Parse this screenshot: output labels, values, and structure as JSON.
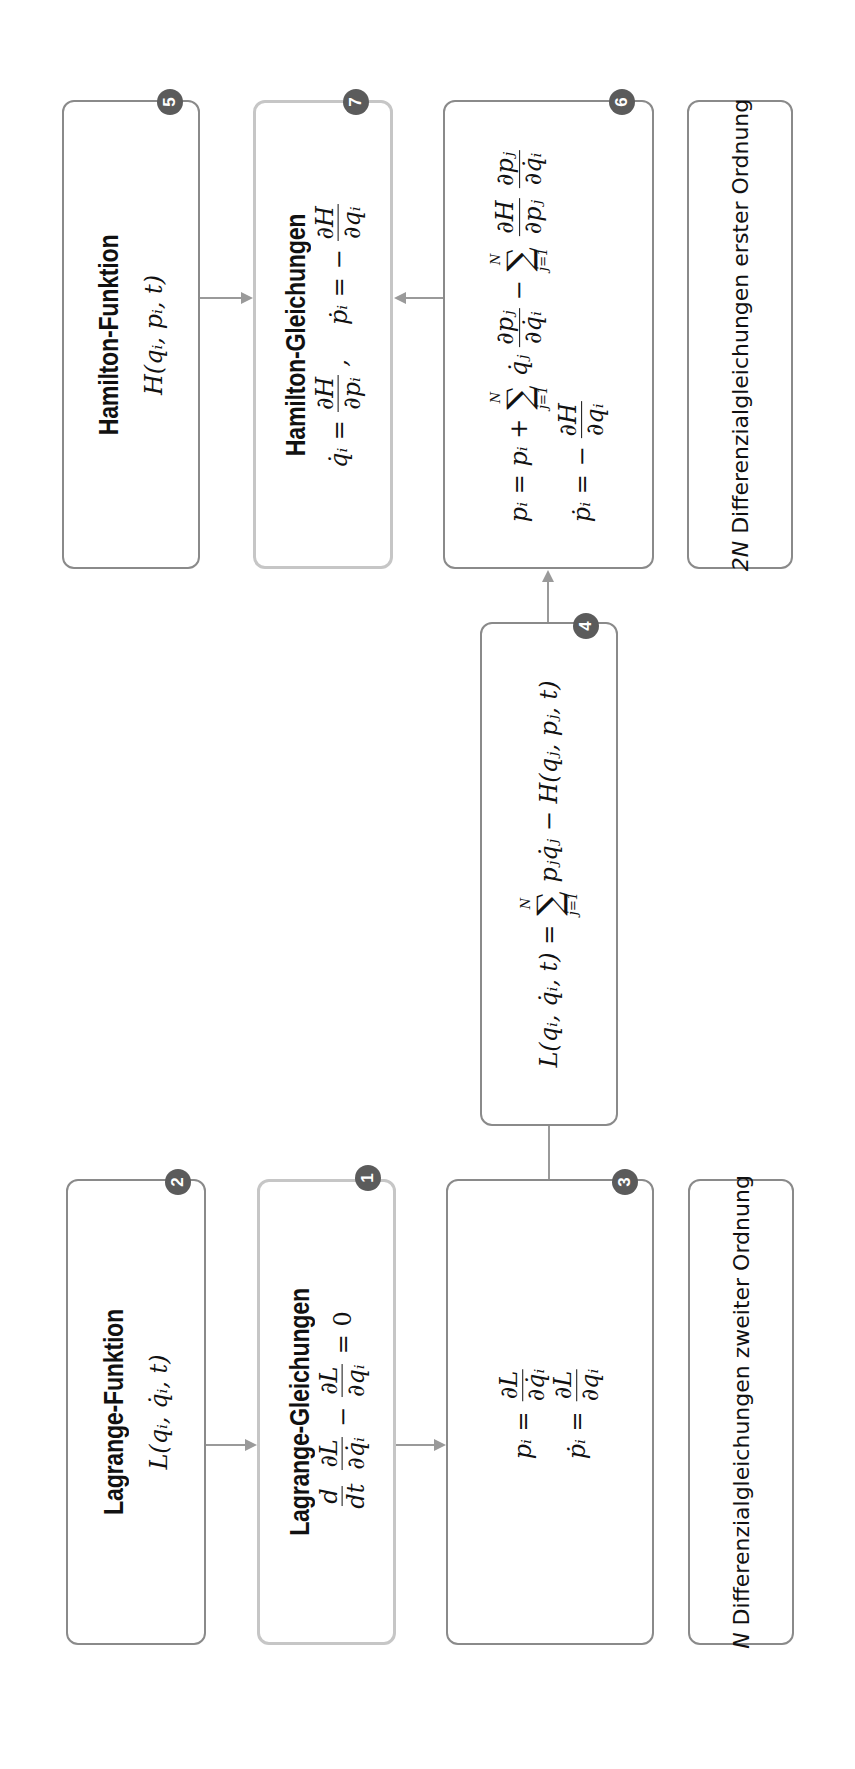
{
  "diagram": {
    "orientation": "rotated-90-ccw",
    "colors": {
      "border": "#8a8a8a",
      "border_highlight": "#c6c6c6",
      "badge": "#5b5b5b",
      "arrow": "#9a9a9a"
    },
    "nodes": {
      "n1": {
        "badge": "1",
        "title": "Lagrange-Gleichungen",
        "eq": {
          "a_num": "d",
          "a_den": "dt",
          "b_num": "∂L",
          "b_den": "∂q̇ᵢ",
          "minus": "−",
          "c_num": "∂L",
          "c_den": "∂qᵢ",
          "rhs": "= 0"
        }
      },
      "n2": {
        "badge": "2",
        "title": "Lagrange-Funktion",
        "expr": "L(qᵢ, q̇ᵢ, t)"
      },
      "n3": {
        "badge": "3",
        "eq1": {
          "lhs": "pᵢ =",
          "num": "∂L",
          "den": "∂q̇ᵢ"
        },
        "eq2": {
          "lhs": "ṗᵢ =",
          "num": "∂L",
          "den": "∂qᵢ"
        }
      },
      "n4": {
        "badge": "4",
        "eq": {
          "lhs": "L(qᵢ, q̇ᵢ, t) =",
          "sum_sup": "N",
          "sum_sub": "j=1",
          "sigma": "∑",
          "rhs": "pⱼq̇ⱼ − H(qⱼ, pⱼ, t)"
        }
      },
      "n5": {
        "badge": "5",
        "title": "Hamilton-Funktion",
        "expr": "H(qᵢ, pᵢ, t)"
      },
      "n6": {
        "badge": "6",
        "eq1": {
          "lhs": "pᵢ = pᵢ +",
          "sum_sup": "N",
          "sum_sub": "j=1",
          "sigma": "∑",
          "term1": "q̇ⱼ",
          "f1_num": "∂pⱼ",
          "f1_den": "∂q̇ᵢ",
          "minus": "−",
          "f2_num": "∂H",
          "f2_den": "∂pⱼ",
          "f3_num": "∂pⱼ",
          "f3_den": "∂q̇ᵢ"
        },
        "eq2": {
          "lhs": "ṗᵢ = −",
          "num": "∂H",
          "den": "∂qᵢ"
        }
      },
      "n7": {
        "badge": "7",
        "title": "Hamilton-Gleichungen",
        "eq": {
          "a_lhs": "q̇ᵢ =",
          "a_num": "∂H",
          "a_den": "∂pᵢ",
          "sep": ",",
          "b_lhs": "ṗᵢ = −",
          "b_num": "∂H",
          "b_den": "∂qᵢ"
        }
      },
      "summary_lagrange": {
        "var": "N",
        "text": " Differenzialgleichungen zweiter Ordnung"
      },
      "summary_hamilton": {
        "var": "2N",
        "text": " Differenzialgleichungen erster Ordnung"
      }
    },
    "edges": [
      {
        "from": "n2",
        "to": "n1",
        "type": "arrow"
      },
      {
        "from": "n1",
        "to": "n3",
        "type": "arrow"
      },
      {
        "from": "n3",
        "to": "n4",
        "type": "line"
      },
      {
        "from": "n4",
        "to": "n6",
        "type": "arrow"
      },
      {
        "from": "n5",
        "to": "n7",
        "type": "arrow"
      },
      {
        "from": "n6",
        "to": "n7",
        "type": "arrow"
      }
    ]
  }
}
